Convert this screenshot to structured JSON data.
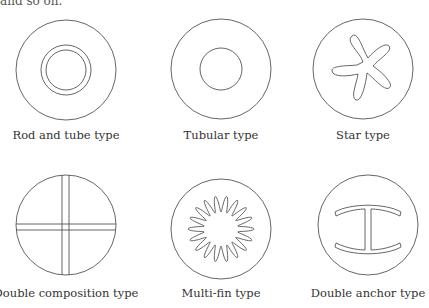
{
  "header": {
    "cut_text": "and so on."
  },
  "figures": [
    {
      "id": "rod-and-tube",
      "label": "Rod and tube type"
    },
    {
      "id": "tubular",
      "label": "Tubular type"
    },
    {
      "id": "star",
      "label": "Star type"
    },
    {
      "id": "double-composition",
      "label": "Double composition type"
    },
    {
      "id": "multi-fin",
      "label": "Multi-fin type"
    },
    {
      "id": "double-anchor",
      "label": "Double anchor type"
    }
  ],
  "colors": {
    "stroke": "#555555",
    "background": "#ffffff",
    "text": "#333333"
  }
}
